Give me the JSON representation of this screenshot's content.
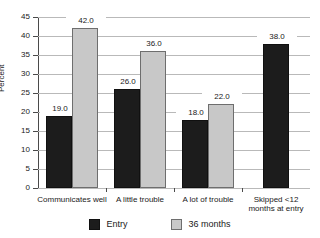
{
  "chart_data": {
    "type": "bar",
    "title": "",
    "xlabel": "",
    "ylabel": "Percent",
    "ylim": [
      0,
      45
    ],
    "yticks": [
      0,
      5,
      10,
      15,
      20,
      25,
      30,
      35,
      40,
      45
    ],
    "grid": true,
    "legend_position": "bottom",
    "categories": [
      "Communicates well",
      "A little trouble",
      "A lot of trouble",
      "Skipped <12\nmonths at entry"
    ],
    "series": [
      {
        "name": "Entry",
        "color": "#1c1c1c",
        "values": [
          19.0,
          26.0,
          18.0,
          38.0
        ],
        "labels": [
          "19.0",
          "26.0",
          "18.0",
          "38.0"
        ]
      },
      {
        "name": "36 months",
        "color": "#c8c8c8",
        "values": [
          42.0,
          36.0,
          22.0,
          null
        ],
        "labels": [
          "42.0",
          "36.0",
          "22.0",
          ""
        ]
      }
    ]
  },
  "legend": {
    "items": [
      {
        "label": "Entry",
        "swatch": "entry-swatch"
      },
      {
        "label": "36 months",
        "swatch": "months36-swatch"
      }
    ]
  }
}
